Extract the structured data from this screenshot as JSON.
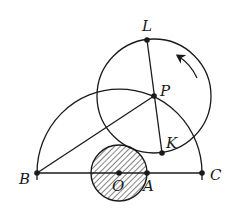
{
  "diagram": {
    "type": "geometry",
    "stroke_color": "#1a1a1a",
    "background": "#ffffff",
    "points": {
      "L": {
        "label": "L",
        "x": 147,
        "y": 40
      },
      "P": {
        "label": "P",
        "x": 154,
        "y": 96
      },
      "K": {
        "label": "K",
        "x": 162,
        "y": 153
      },
      "B": {
        "label": "B",
        "x": 37,
        "y": 173
      },
      "O": {
        "label": "O",
        "x": 119,
        "y": 173
      },
      "A": {
        "label": "A",
        "x": 147,
        "y": 173
      },
      "C": {
        "label": "C",
        "x": 202,
        "y": 173
      }
    },
    "shapes": {
      "large_semicircle": {
        "cx": 119.5,
        "cy": 173,
        "r": 84,
        "description": "semicircle over BC"
      },
      "rolling_circle": {
        "cx": 154,
        "cy": 96,
        "r": 57,
        "center": "P",
        "description": "circle centered at P through L and K"
      },
      "hatched_circle": {
        "cx": 119,
        "cy": 173,
        "r": 28,
        "center": "O",
        "description": "small hatched disk centered at O through A"
      }
    },
    "segments": [
      {
        "from": "B",
        "to": "C"
      },
      {
        "from": "B",
        "to": "P"
      },
      {
        "from": "L",
        "to": "K"
      }
    ],
    "arrow": {
      "direction": "counterclockwise",
      "description": "rotation arrow on circle P"
    }
  }
}
